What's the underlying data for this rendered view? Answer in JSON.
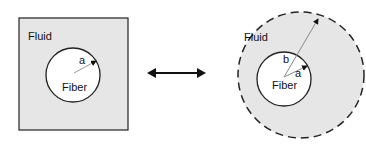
{
  "left_panel": {
    "region_label": "Fluid",
    "fiber_label": "Fiber",
    "radius_label": "a"
  },
  "right_panel": {
    "region_label": "Fluid",
    "fiber_label": "Fiber",
    "inner_radius_label": "a",
    "outer_radius_label": "b"
  },
  "colors": {
    "fluid_fill": "#e6e6e6",
    "fiber_fill": "#ffffff",
    "stroke": "#222222"
  }
}
